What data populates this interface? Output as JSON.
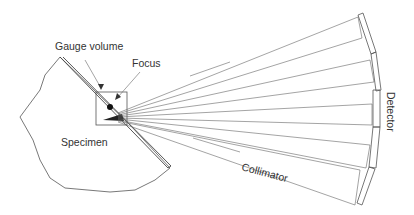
{
  "figure": {
    "type": "schematic"
  },
  "labels": {
    "gauge_volume": "Gauge volume",
    "focus": "Focus",
    "specimen": "Specimen",
    "collimator": "Collimator",
    "detector": "Detector"
  },
  "colors": {
    "line": "#555555",
    "text": "#333333",
    "background": "#ffffff"
  },
  "geometry": {
    "specimen_outline": [
      [
        60,
        57
      ],
      [
        45,
        75
      ],
      [
        40,
        90
      ],
      [
        20,
        117
      ],
      [
        33,
        140
      ],
      [
        40,
        160
      ],
      [
        50,
        178
      ],
      [
        65,
        188
      ],
      [
        110,
        192
      ],
      [
        135,
        190
      ],
      [
        155,
        180
      ],
      [
        170,
        168
      ]
    ],
    "gauge_box": {
      "x": 96,
      "y": 92,
      "w": 31,
      "h": 33
    },
    "focus_point": [
      110,
      107
    ],
    "fan_origin": [
      118,
      117
    ],
    "detector_segments": 6
  }
}
